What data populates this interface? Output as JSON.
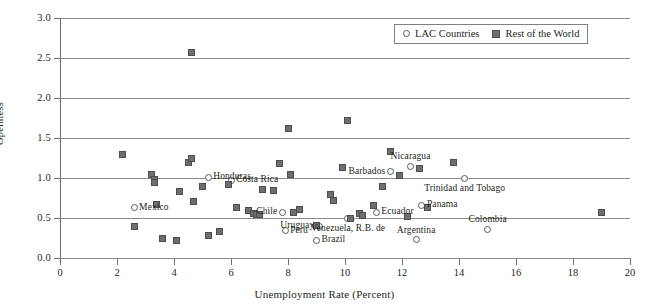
{
  "chart_data": {
    "type": "scatter",
    "title": "",
    "xlabel": "Unemployment Rate (Percent)",
    "ylabel": "Openness",
    "xlim": [
      0,
      20
    ],
    "ylim": [
      0.0,
      3.0
    ],
    "xticks": [
      "0",
      "2",
      "4",
      "6",
      "8",
      "10",
      "12",
      "14",
      "16",
      "18",
      "20"
    ],
    "yticks": [
      "0.0",
      "0.5",
      "1.0",
      "1.5",
      "2.0",
      "2.5",
      "3.0"
    ],
    "grid": "horizontal",
    "legend_position": "top-right",
    "legend": [
      {
        "label": "LAC Countries",
        "marker": "open-circle"
      },
      {
        "label": "Rest of the World",
        "marker": "filled-square"
      }
    ],
    "series": [
      {
        "name": "LAC Countries",
        "marker": "open-circle",
        "points": [
          {
            "label": "Mexico",
            "x": 2.6,
            "y": 0.63,
            "label_pos": "right"
          },
          {
            "label": "Honduras",
            "x": 5.2,
            "y": 1.01,
            "label_pos": "right"
          },
          {
            "label": "Costa Rica",
            "x": 6.0,
            "y": 0.97,
            "label_pos": "right"
          },
          {
            "label": "Chile",
            "x": 7.8,
            "y": 0.57,
            "label_pos": "left"
          },
          {
            "label": "Peru",
            "x": 7.9,
            "y": 0.34,
            "label_pos": "right"
          },
          {
            "label": "Uruguay",
            "x": 9.1,
            "y": 0.4,
            "label_pos": "left"
          },
          {
            "label": "Brazil",
            "x": 9.0,
            "y": 0.22,
            "label_pos": "right"
          },
          {
            "label": "Venezuela, R.B. de",
            "x": 10.1,
            "y": 0.5,
            "label_pos": "below"
          },
          {
            "label": "Ecuador",
            "x": 11.1,
            "y": 0.57,
            "label_pos": "right"
          },
          {
            "label": "Barbados",
            "x": 11.6,
            "y": 1.08,
            "label_pos": "left"
          },
          {
            "label": "Nicaragua",
            "x": 12.3,
            "y": 1.15,
            "label_pos": "above"
          },
          {
            "label": "Argentina",
            "x": 12.5,
            "y": 0.23,
            "label_pos": "above"
          },
          {
            "label": "Panama",
            "x": 12.7,
            "y": 0.66,
            "label_pos": "right"
          },
          {
            "label": "Trinidad and Tobago",
            "x": 14.2,
            "y": 1.0,
            "label_pos": "below"
          },
          {
            "label": "Colombia",
            "x": 15.0,
            "y": 0.36,
            "label_pos": "above"
          }
        ]
      },
      {
        "name": "Rest of the World",
        "marker": "filled-square",
        "points": [
          {
            "x": 2.2,
            "y": 1.3
          },
          {
            "x": 2.6,
            "y": 0.4
          },
          {
            "x": 3.2,
            "y": 1.04
          },
          {
            "x": 3.3,
            "y": 0.98
          },
          {
            "x": 3.3,
            "y": 0.95
          },
          {
            "x": 3.4,
            "y": 0.67
          },
          {
            "x": 3.6,
            "y": 0.24
          },
          {
            "x": 4.1,
            "y": 0.22
          },
          {
            "x": 4.2,
            "y": 0.83
          },
          {
            "x": 4.5,
            "y": 1.2
          },
          {
            "x": 4.6,
            "y": 2.57
          },
          {
            "x": 4.6,
            "y": 1.25
          },
          {
            "x": 4.7,
            "y": 0.71
          },
          {
            "x": 5.0,
            "y": 0.9
          },
          {
            "x": 5.2,
            "y": 0.28
          },
          {
            "x": 5.6,
            "y": 0.33
          },
          {
            "x": 5.9,
            "y": 0.92
          },
          {
            "x": 6.2,
            "y": 0.63
          },
          {
            "x": 6.6,
            "y": 0.6
          },
          {
            "x": 6.8,
            "y": 0.56
          },
          {
            "x": 6.9,
            "y": 0.54
          },
          {
            "x": 7.0,
            "y": 0.55
          },
          {
            "x": 7.1,
            "y": 0.86
          },
          {
            "x": 7.5,
            "y": 0.85
          },
          {
            "x": 7.7,
            "y": 1.18
          },
          {
            "x": 8.0,
            "y": 1.62
          },
          {
            "x": 8.1,
            "y": 1.04
          },
          {
            "x": 8.2,
            "y": 0.57
          },
          {
            "x": 8.4,
            "y": 0.61
          },
          {
            "x": 9.0,
            "y": 0.41
          },
          {
            "x": 9.5,
            "y": 0.79
          },
          {
            "x": 9.6,
            "y": 0.72
          },
          {
            "x": 9.9,
            "y": 1.13
          },
          {
            "x": 10.1,
            "y": 1.72
          },
          {
            "x": 10.2,
            "y": 0.5
          },
          {
            "x": 10.5,
            "y": 0.56
          },
          {
            "x": 10.6,
            "y": 0.53
          },
          {
            "x": 11.0,
            "y": 0.66
          },
          {
            "x": 11.3,
            "y": 0.89
          },
          {
            "x": 11.6,
            "y": 1.33
          },
          {
            "x": 11.9,
            "y": 1.03
          },
          {
            "x": 12.2,
            "y": 0.52
          },
          {
            "x": 12.6,
            "y": 1.12
          },
          {
            "x": 12.9,
            "y": 0.63
          },
          {
            "x": 13.8,
            "y": 1.2
          },
          {
            "x": 19.0,
            "y": 0.57
          }
        ]
      }
    ]
  }
}
